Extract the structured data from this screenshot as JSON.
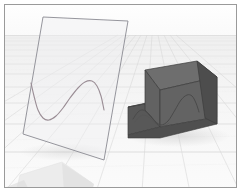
{
  "viewport": {
    "name": "3d-modeling-viewport",
    "width": 241,
    "height": 192,
    "background_color": "#ffffff",
    "border_color": "#9a9a9a",
    "border_inset": 4
  },
  "environment": {
    "sky_color": "#fcfcfc",
    "horizon_y": 35,
    "ground_color": "#f2f2f2",
    "grid_line_color": "#d6d6d6",
    "grid_line_color_far": "#e2e2e2",
    "grid_minor_color": "#e8e8e8",
    "ground_shadow_color": "#e0e0e0"
  },
  "sketch_plane": {
    "label": "sketch-plane-quad",
    "fill_color": "#f0f0f2",
    "fill_opacity": 0.45,
    "edge_color": "#8a8a92",
    "edge_width": 0.9,
    "corners": {
      "top_left": [
        43,
        17
      ],
      "top_right": [
        128,
        21
      ],
      "bottom_right": [
        104,
        160
      ],
      "bottom_left": [
        23,
        134
      ]
    }
  },
  "sine_curve_sketch": {
    "label": "sine-wave-profile-curve",
    "stroke_color": "#9a8d95",
    "stroke_width": 1.1,
    "path_points": [
      [
        31,
        83
      ],
      [
        34,
        96
      ],
      [
        38,
        110
      ],
      [
        43,
        118
      ],
      [
        49,
        120
      ],
      [
        56,
        116
      ],
      [
        63,
        108
      ],
      [
        70,
        98
      ],
      [
        78,
        88
      ],
      [
        85,
        82
      ],
      [
        92,
        81
      ],
      [
        97,
        86
      ],
      [
        101,
        96
      ],
      [
        104,
        110
      ]
    ]
  },
  "solid_cube": {
    "label": "extruded-cube-with-sine-cut",
    "top_face_color": "#6e6e6e",
    "front_face_color": "#636363",
    "right_face_color": "#4d4d4d",
    "step_top_color": "#646464",
    "step_front_color": "#585858",
    "edge_color": "#3c3c3c",
    "edge_width": 0.7,
    "cut_curve_color": "#4a4a4a",
    "cut_curve_width": 1.0,
    "geometry": {
      "top_back_left": [
        145,
        70
      ],
      "top_back_right": [
        197,
        61
      ],
      "top_front_right": [
        217,
        78
      ],
      "top_front_left": [
        160,
        90
      ],
      "bottom_front_left": [
        160,
        126
      ],
      "bottom_front_right": [
        217,
        116
      ],
      "bottom_back_right": [
        217,
        78
      ],
      "step_left_x": 128,
      "step_top_y": 105,
      "step_bottom_y": 138
    },
    "cut_curve_points": [
      [
        133,
        119
      ],
      [
        138,
        112
      ],
      [
        143,
        110
      ],
      [
        149,
        114
      ],
      [
        155,
        121
      ],
      [
        161,
        125
      ],
      [
        168,
        121
      ],
      [
        175,
        110
      ],
      [
        181,
        100
      ],
      [
        187,
        95
      ],
      [
        192,
        96
      ],
      [
        196,
        103
      ],
      [
        199,
        112
      ]
    ]
  },
  "foreground_object": {
    "label": "foreground-pale-slab",
    "fill_color": "#ececec",
    "shade_color": "#e3e3e3",
    "points": [
      [
        20,
        175
      ],
      [
        62,
        162
      ],
      [
        92,
        183
      ],
      [
        90,
        192
      ],
      [
        16,
        192
      ]
    ]
  }
}
